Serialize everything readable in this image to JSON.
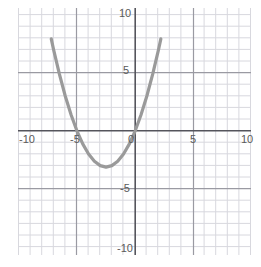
{
  "figure": {
    "name": "coordinate-plane-parabola",
    "background": "#ffffff",
    "grid_color_minor": "#d8d8de",
    "grid_color_major": "#9a9aa2",
    "axis_color": "#55555c",
    "curve_color": "#9a9a9a",
    "label_color": "#5a5a5a"
  },
  "chart_data": {
    "type": "line",
    "title": "",
    "xlabel": "",
    "ylabel": "",
    "xlim": [
      -11,
      10
    ],
    "ylim": [
      -11,
      10.5
    ],
    "grid": true,
    "minor_grid_step": 1,
    "major_grid_step": 5,
    "legend": "none",
    "x_tick_labels": [
      "-10",
      "-5",
      "0",
      "5",
      "10"
    ],
    "x_tick_values": [
      -10,
      -5,
      0,
      5,
      10
    ],
    "y_tick_labels": [
      "10",
      "5",
      "-5",
      "-10"
    ],
    "y_tick_values": [
      10,
      5,
      -5,
      -10
    ],
    "series": [
      {
        "name": "parabola",
        "equation": "y = 0.5x^2 + 2.5x",
        "vertex": [
          -2.5,
          -3.1
        ],
        "roots": [
          -5,
          0
        ],
        "color": "#9a9a9a",
        "x": [
          -7.2,
          -7.0,
          -6.5,
          -6.0,
          -5.5,
          -5.0,
          -4.5,
          -4.0,
          -3.5,
          -3.0,
          -2.5,
          -2.0,
          -1.5,
          -1.0,
          -0.5,
          0.0,
          0.5,
          1.0,
          1.5,
          2.0,
          2.2
        ],
        "values": [
          7.92,
          7.0,
          4.88,
          3.0,
          1.38,
          0.0,
          -1.13,
          -2.0,
          -2.63,
          -3.0,
          -3.13,
          -3.0,
          -2.63,
          -2.0,
          -1.13,
          0.0,
          1.38,
          3.0,
          4.88,
          7.0,
          7.92
        ]
      }
    ]
  },
  "ticks": {
    "x": [
      {
        "label": "-10",
        "value": -10
      },
      {
        "label": "-5",
        "value": -5
      },
      {
        "label": "0",
        "value": 0
      },
      {
        "label": "5",
        "value": 5
      },
      {
        "label": "10",
        "value": 10
      }
    ],
    "y": [
      {
        "label": "10",
        "value": 10
      },
      {
        "label": "5",
        "value": 5
      },
      {
        "label": "-5",
        "value": -5
      },
      {
        "label": "-10",
        "value": -10
      }
    ]
  }
}
